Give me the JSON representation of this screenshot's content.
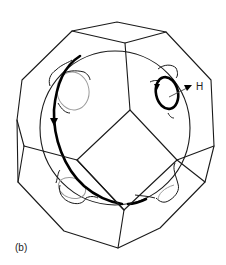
{
  "figure": {
    "panel_label": "(b)",
    "field_label": "H",
    "elements": {
      "brillouin_zone": "truncated-octahedron",
      "fermi_surface": "sphere-with-necks",
      "orbits": [
        "belly-orbit",
        "neck-orbit"
      ],
      "field_direction": "H"
    },
    "colors": {
      "line": "#1a1a1a",
      "orbit": "#000000",
      "hidden_line": "#9a9a9a",
      "background": "#ffffff"
    }
  }
}
